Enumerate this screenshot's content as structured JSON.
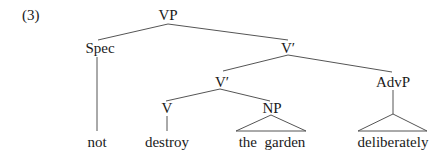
{
  "example_number": "(3)",
  "tree": {
    "nodes": [
      {
        "id": "vp",
        "label": "VP"
      },
      {
        "id": "spec",
        "label": "Spec"
      },
      {
        "id": "vbar1",
        "label": "V′"
      },
      {
        "id": "vbar2",
        "label": "V′"
      },
      {
        "id": "advp",
        "label": "AdvP"
      },
      {
        "id": "v",
        "label": "V"
      },
      {
        "id": "np",
        "label": "NP"
      }
    ],
    "leaves": [
      {
        "id": "not",
        "label": "not",
        "parent": "spec",
        "style": "line"
      },
      {
        "id": "destroy",
        "label": "destroy",
        "parent": "v",
        "style": "line"
      },
      {
        "id": "the-garden",
        "label": "the  garden",
        "parent": "np",
        "style": "triangle"
      },
      {
        "id": "deliberately",
        "label": "deliberately",
        "parent": "advp",
        "style": "line-triangle"
      }
    ],
    "edges": [
      [
        "vp",
        "spec"
      ],
      [
        "vp",
        "vbar1"
      ],
      [
        "vbar1",
        "vbar2"
      ],
      [
        "vbar1",
        "advp"
      ],
      [
        "vbar2",
        "v"
      ],
      [
        "vbar2",
        "np"
      ]
    ]
  }
}
